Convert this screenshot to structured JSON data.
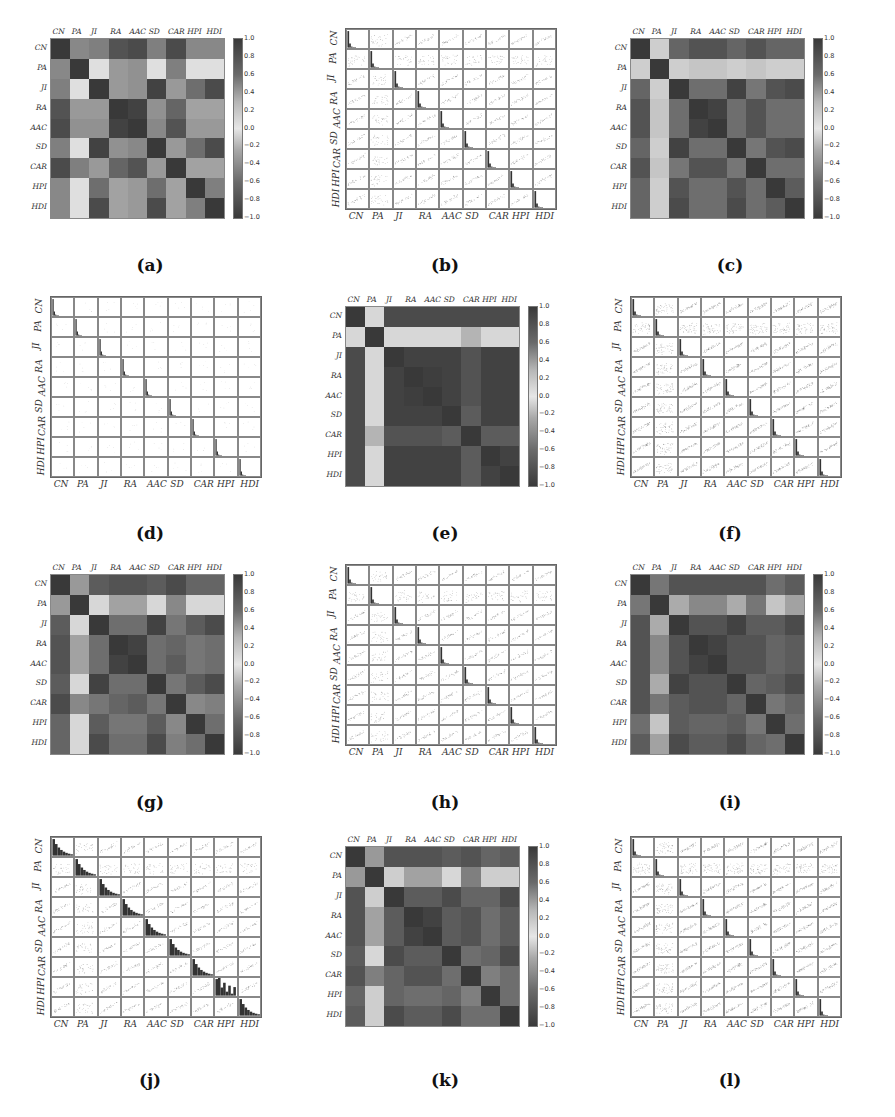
{
  "figure": {
    "variables": [
      "CN",
      "PA",
      "JI",
      "RA",
      "AAC",
      "SD",
      "CAR",
      "HPI",
      "HDI"
    ],
    "colorbar_ticks": [
      "1.0",
      "0.8",
      "0.6",
      "0.4",
      "0.2",
      "0.0",
      "−0.2",
      "−0.4",
      "−0.6",
      "−0.8",
      "−1.0"
    ],
    "panels": [
      {
        "id": "a",
        "caption": "(a)",
        "type": "heatmap"
      },
      {
        "id": "b",
        "caption": "(b)",
        "type": "scatter_matrix"
      },
      {
        "id": "c",
        "caption": "(c)",
        "type": "heatmap"
      },
      {
        "id": "d",
        "caption": "(d)",
        "type": "scatter_matrix"
      },
      {
        "id": "e",
        "caption": "(e)",
        "type": "heatmap"
      },
      {
        "id": "f",
        "caption": "(f)",
        "type": "scatter_matrix"
      },
      {
        "id": "g",
        "caption": "(g)",
        "type": "heatmap"
      },
      {
        "id": "h",
        "caption": "(h)",
        "type": "scatter_matrix"
      },
      {
        "id": "i",
        "caption": "(i)",
        "type": "heatmap"
      },
      {
        "id": "j",
        "caption": "(j)",
        "type": "scatter_matrix"
      },
      {
        "id": "k",
        "caption": "(k)",
        "type": "heatmap"
      },
      {
        "id": "l",
        "caption": "(l)",
        "type": "scatter_matrix"
      }
    ]
  },
  "chart_data": [
    {
      "panel": "a",
      "type": "heatmap",
      "title": "(a)",
      "x_labels": [
        "CN",
        "PA",
        "JI",
        "RA",
        "AAC",
        "SD",
        "CAR",
        "HPI",
        "HDI"
      ],
      "y_labels": [
        "CN",
        "PA",
        "JI",
        "RA",
        "AAC",
        "SD",
        "CAR",
        "HPI",
        "HDI"
      ],
      "colorbar_range": [
        -1.0,
        1.0
      ],
      "values": [
        [
          1.0,
          0.55,
          0.6,
          0.85,
          0.9,
          0.6,
          0.9,
          0.55,
          0.55
        ],
        [
          0.55,
          1.0,
          0.05,
          0.45,
          0.5,
          0.05,
          0.6,
          0.05,
          0.05
        ],
        [
          0.6,
          0.05,
          1.0,
          0.45,
          0.5,
          0.95,
          0.45,
          0.7,
          0.9
        ],
        [
          0.85,
          0.45,
          0.45,
          1.0,
          0.95,
          0.5,
          0.75,
          0.4,
          0.4
        ],
        [
          0.9,
          0.5,
          0.5,
          0.95,
          1.0,
          0.55,
          0.85,
          0.45,
          0.45
        ],
        [
          0.6,
          0.05,
          0.95,
          0.5,
          0.55,
          1.0,
          0.45,
          0.7,
          0.9
        ],
        [
          0.9,
          0.6,
          0.45,
          0.75,
          0.85,
          0.45,
          1.0,
          0.4,
          0.4
        ],
        [
          0.55,
          0.05,
          0.7,
          0.4,
          0.45,
          0.7,
          0.4,
          1.0,
          0.6
        ],
        [
          0.55,
          0.05,
          0.9,
          0.4,
          0.45,
          0.9,
          0.4,
          0.6,
          1.0
        ]
      ]
    },
    {
      "panel": "c",
      "type": "heatmap",
      "title": "(c)",
      "x_labels": [
        "CN",
        "PA",
        "JI",
        "RA",
        "AAC",
        "SD",
        "CAR",
        "HPI",
        "HDI"
      ],
      "y_labels": [
        "CN",
        "PA",
        "JI",
        "RA",
        "AAC",
        "SD",
        "CAR",
        "HPI",
        "HDI"
      ],
      "colorbar_range": [
        -1.0,
        1.0
      ],
      "values": [
        [
          1.0,
          0.15,
          0.75,
          0.85,
          0.85,
          0.75,
          0.85,
          0.75,
          0.75
        ],
        [
          0.15,
          1.0,
          0.15,
          0.2,
          0.2,
          0.15,
          0.2,
          0.15,
          0.15
        ],
        [
          0.75,
          0.15,
          1.0,
          0.7,
          0.7,
          0.95,
          0.65,
          0.85,
          0.9
        ],
        [
          0.85,
          0.2,
          0.7,
          1.0,
          0.95,
          0.7,
          0.85,
          0.7,
          0.7
        ],
        [
          0.85,
          0.2,
          0.7,
          0.95,
          1.0,
          0.7,
          0.85,
          0.7,
          0.7
        ],
        [
          0.75,
          0.15,
          0.95,
          0.7,
          0.7,
          1.0,
          0.65,
          0.85,
          0.9
        ],
        [
          0.85,
          0.2,
          0.65,
          0.85,
          0.85,
          0.65,
          1.0,
          0.7,
          0.7
        ],
        [
          0.75,
          0.15,
          0.85,
          0.7,
          0.7,
          0.85,
          0.7,
          1.0,
          0.8
        ],
        [
          0.75,
          0.15,
          0.9,
          0.7,
          0.7,
          0.9,
          0.7,
          0.8,
          1.0
        ]
      ]
    },
    {
      "panel": "e",
      "type": "heatmap",
      "title": "(e)",
      "x_labels": [
        "CN",
        "PA",
        "JI",
        "RA",
        "AAC",
        "SD",
        "CAR",
        "HPI",
        "HDI"
      ],
      "y_labels": [
        "CN",
        "PA",
        "JI",
        "RA",
        "AAC",
        "SD",
        "CAR",
        "HPI",
        "HDI"
      ],
      "colorbar_range": [
        -1.0,
        1.0
      ],
      "values": [
        [
          1.0,
          0.1,
          0.9,
          0.9,
          0.9,
          0.9,
          0.9,
          0.9,
          0.9
        ],
        [
          0.1,
          1.0,
          0.1,
          0.1,
          0.1,
          0.1,
          0.3,
          0.1,
          0.1
        ],
        [
          0.9,
          0.1,
          1.0,
          0.95,
          0.95,
          0.95,
          0.85,
          0.95,
          0.95
        ],
        [
          0.9,
          0.1,
          0.95,
          1.0,
          0.97,
          0.95,
          0.85,
          0.95,
          0.95
        ],
        [
          0.9,
          0.1,
          0.95,
          0.97,
          1.0,
          0.95,
          0.85,
          0.95,
          0.95
        ],
        [
          0.9,
          0.1,
          0.95,
          0.95,
          0.95,
          1.0,
          0.8,
          0.95,
          0.95
        ],
        [
          0.9,
          0.3,
          0.85,
          0.85,
          0.85,
          0.8,
          1.0,
          0.8,
          0.8
        ],
        [
          0.9,
          0.1,
          0.95,
          0.95,
          0.95,
          0.95,
          0.8,
          1.0,
          0.95
        ],
        [
          0.9,
          0.1,
          0.95,
          0.95,
          0.95,
          0.95,
          0.8,
          0.95,
          1.0
        ]
      ]
    },
    {
      "panel": "g",
      "type": "heatmap",
      "title": "(g)",
      "x_labels": [
        "CN",
        "PA",
        "JI",
        "RA",
        "AAC",
        "SD",
        "CAR",
        "HPI",
        "HDI"
      ],
      "y_labels": [
        "CN",
        "PA",
        "JI",
        "RA",
        "AAC",
        "SD",
        "CAR",
        "HPI",
        "HDI"
      ],
      "colorbar_range": [
        -1.0,
        1.0
      ],
      "values": [
        [
          1.0,
          0.45,
          0.8,
          0.85,
          0.85,
          0.8,
          0.9,
          0.75,
          0.75
        ],
        [
          0.45,
          1.0,
          0.1,
          0.4,
          0.4,
          0.1,
          0.55,
          0.1,
          0.1
        ],
        [
          0.8,
          0.1,
          1.0,
          0.7,
          0.7,
          0.95,
          0.65,
          0.8,
          0.9
        ],
        [
          0.85,
          0.4,
          0.7,
          1.0,
          0.95,
          0.7,
          0.75,
          0.65,
          0.7
        ],
        [
          0.85,
          0.4,
          0.7,
          0.95,
          1.0,
          0.7,
          0.8,
          0.65,
          0.7
        ],
        [
          0.8,
          0.1,
          0.95,
          0.7,
          0.7,
          1.0,
          0.65,
          0.8,
          0.9
        ],
        [
          0.9,
          0.55,
          0.65,
          0.75,
          0.8,
          0.65,
          1.0,
          0.55,
          0.6
        ],
        [
          0.75,
          0.1,
          0.8,
          0.65,
          0.65,
          0.8,
          0.55,
          1.0,
          0.7
        ],
        [
          0.75,
          0.1,
          0.9,
          0.7,
          0.7,
          0.9,
          0.6,
          0.7,
          1.0
        ]
      ]
    },
    {
      "panel": "i",
      "type": "heatmap",
      "title": "(i)",
      "x_labels": [
        "CN",
        "PA",
        "JI",
        "RA",
        "AAC",
        "SD",
        "CAR",
        "HPI",
        "HDI"
      ],
      "y_labels": [
        "CN",
        "PA",
        "JI",
        "RA",
        "AAC",
        "SD",
        "CAR",
        "HPI",
        "HDI"
      ],
      "colorbar_range": [
        -1.0,
        1.0
      ],
      "values": [
        [
          1.0,
          0.65,
          0.85,
          0.85,
          0.85,
          0.85,
          0.85,
          0.7,
          0.8
        ],
        [
          0.65,
          1.0,
          0.35,
          0.55,
          0.55,
          0.35,
          0.65,
          0.2,
          0.4
        ],
        [
          0.85,
          0.35,
          1.0,
          0.85,
          0.85,
          0.95,
          0.8,
          0.8,
          0.9
        ],
        [
          0.85,
          0.55,
          0.85,
          1.0,
          0.95,
          0.85,
          0.85,
          0.75,
          0.8
        ],
        [
          0.85,
          0.55,
          0.85,
          0.95,
          1.0,
          0.85,
          0.85,
          0.75,
          0.8
        ],
        [
          0.85,
          0.35,
          0.95,
          0.85,
          0.85,
          1.0,
          0.75,
          0.8,
          0.9
        ],
        [
          0.85,
          0.65,
          0.8,
          0.85,
          0.85,
          0.75,
          1.0,
          0.65,
          0.75
        ],
        [
          0.7,
          0.2,
          0.8,
          0.75,
          0.75,
          0.8,
          0.65,
          1.0,
          0.7
        ],
        [
          0.8,
          0.4,
          0.9,
          0.8,
          0.8,
          0.9,
          0.75,
          0.7,
          1.0
        ]
      ]
    },
    {
      "panel": "k",
      "type": "heatmap",
      "title": "(k)",
      "x_labels": [
        "CN",
        "PA",
        "JI",
        "RA",
        "AAC",
        "SD",
        "CAR",
        "HPI",
        "HDI"
      ],
      "y_labels": [
        "CN",
        "PA",
        "JI",
        "RA",
        "AAC",
        "SD",
        "CAR",
        "HPI",
        "HDI"
      ],
      "colorbar_range": [
        -1.0,
        1.0
      ],
      "values": [
        [
          1.0,
          0.45,
          0.85,
          0.85,
          0.85,
          0.8,
          0.85,
          0.75,
          0.8
        ],
        [
          0.45,
          1.0,
          0.15,
          0.4,
          0.4,
          0.1,
          0.6,
          0.15,
          0.15
        ],
        [
          0.85,
          0.15,
          1.0,
          0.8,
          0.8,
          0.9,
          0.75,
          0.75,
          0.9
        ],
        [
          0.85,
          0.4,
          0.8,
          1.0,
          0.95,
          0.8,
          0.85,
          0.7,
          0.8
        ],
        [
          0.85,
          0.4,
          0.8,
          0.95,
          1.0,
          0.8,
          0.85,
          0.7,
          0.8
        ],
        [
          0.8,
          0.1,
          0.9,
          0.8,
          0.8,
          1.0,
          0.7,
          0.75,
          0.9
        ],
        [
          0.85,
          0.6,
          0.75,
          0.85,
          0.85,
          0.7,
          1.0,
          0.6,
          0.7
        ],
        [
          0.75,
          0.15,
          0.75,
          0.7,
          0.7,
          0.75,
          0.6,
          1.0,
          0.7
        ],
        [
          0.8,
          0.15,
          0.9,
          0.8,
          0.8,
          0.9,
          0.7,
          0.7,
          1.0
        ]
      ]
    },
    {
      "panel": "b",
      "type": "scatter",
      "title": "(b)",
      "description": "9x9 scatter matrix; diagonal histograms (skewed right); strong linear CN-RA-AAC-CAR, JI-SD-HDI curve",
      "x_labels": [
        "CN",
        "PA",
        "JI",
        "RA",
        "AAC",
        "SD",
        "CAR",
        "HPI",
        "HDI"
      ],
      "y_labels": [
        "CN",
        "PA",
        "JI",
        "RA",
        "AAC",
        "SD",
        "CAR",
        "HPI",
        "HDI"
      ]
    },
    {
      "panel": "d",
      "type": "scatter",
      "title": "(d)",
      "description": "9x9 scatter matrix; sparse points, narrow spike histograms on diagonal",
      "x_labels": [
        "CN",
        "PA",
        "JI",
        "RA",
        "AAC",
        "SD",
        "CAR",
        "HPI",
        "HDI"
      ],
      "y_labels": [
        "CN",
        "PA",
        "JI",
        "RA",
        "AAC",
        "SD",
        "CAR",
        "HPI",
        "HDI"
      ]
    },
    {
      "panel": "f",
      "type": "scatter",
      "title": "(f)",
      "description": "9x9 scatter matrix; dense positive-correlation clouds, histograms on diagonal",
      "x_labels": [
        "CN",
        "PA",
        "JI",
        "RA",
        "AAC",
        "SD",
        "CAR",
        "HPI",
        "HDI"
      ],
      "y_labels": [
        "CN",
        "PA",
        "JI",
        "RA",
        "AAC",
        "SD",
        "CAR",
        "HPI",
        "HDI"
      ]
    },
    {
      "panel": "h",
      "type": "scatter",
      "title": "(h)",
      "description": "9x9 scatter matrix; clustered points, skewed histograms on diagonal",
      "x_labels": [
        "CN",
        "PA",
        "JI",
        "RA",
        "AAC",
        "SD",
        "CAR",
        "HPI",
        "HDI"
      ],
      "y_labels": [
        "CN",
        "PA",
        "JI",
        "RA",
        "AAC",
        "SD",
        "CAR",
        "HPI",
        "HDI"
      ]
    },
    {
      "panel": "j",
      "type": "scatter",
      "title": "(j)",
      "description": "9x9 scatter matrix; wide step histograms on diagonal, linear banded scatter",
      "x_labels": [
        "CN",
        "PA",
        "JI",
        "RA",
        "AAC",
        "SD",
        "CAR",
        "HPI",
        "HDI"
      ],
      "y_labels": [
        "CN",
        "PA",
        "JI",
        "RA",
        "AAC",
        "SD",
        "CAR",
        "HPI",
        "HDI"
      ]
    },
    {
      "panel": "l",
      "type": "scatter",
      "title": "(l)",
      "description": "9x9 scatter matrix; dense diffuse positive clouds, skewed histograms on diagonal",
      "x_labels": [
        "CN",
        "PA",
        "JI",
        "RA",
        "AAC",
        "SD",
        "CAR",
        "HPI",
        "HDI"
      ],
      "y_labels": [
        "CN",
        "PA",
        "JI",
        "RA",
        "AAC",
        "SD",
        "CAR",
        "HPI",
        "HDI"
      ]
    }
  ]
}
